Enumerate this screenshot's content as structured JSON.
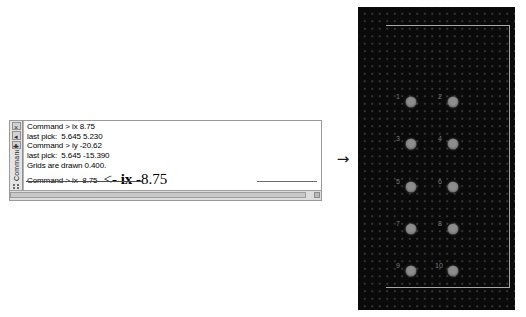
{
  "command_window": {
    "dock": {
      "title": "Command",
      "close_icon_label": "×",
      "collapse_icon_label": "◂",
      "pin_icon_label": "✚",
      "grip_name": "dock-grip"
    },
    "lines": [
      "Command > ix 8.75",
      "last pick:  5.645 5.230",
      "Command > iy -20.62",
      "last pick:  5.645 -15.390",
      "Grids are drawn 0.400.",
      "Command > ix -8.75"
    ],
    "annotation": {
      "arrow": "<- ",
      "command": "ix",
      "value": " -8.75"
    },
    "scrollbar": {
      "orientation": "horizontal",
      "thumb_name": "hscroll-thumb",
      "right_button_name": "hscroll-right-button"
    }
  },
  "flow": {
    "arrow": "→"
  },
  "pcb_panel": {
    "background_color": "#0a0a0a",
    "grid_dot_color": "#3b3b3b",
    "outline_color": "#a8a8a8",
    "pad_color": "#8d8d8d",
    "label_color": "#7c7c7c",
    "pads": [
      {
        "label": "1",
        "cx": 53,
        "cy": 95,
        "label_x": 40,
        "label_y": 89
      },
      {
        "label": "2",
        "cx": 95,
        "cy": 95,
        "label_x": 82,
        "label_y": 89
      },
      {
        "label": "3",
        "cx": 53,
        "cy": 137,
        "label_x": 40,
        "label_y": 131
      },
      {
        "label": "4",
        "cx": 95,
        "cy": 137,
        "label_x": 82,
        "label_y": 131
      },
      {
        "label": "5",
        "cx": 53,
        "cy": 180,
        "label_x": 40,
        "label_y": 174
      },
      {
        "label": "6",
        "cx": 95,
        "cy": 180,
        "label_x": 82,
        "label_y": 174
      },
      {
        "label": "7",
        "cx": 53,
        "cy": 222,
        "label_x": 40,
        "label_y": 216
      },
      {
        "label": "8",
        "cx": 95,
        "cy": 222,
        "label_x": 82,
        "label_y": 216
      },
      {
        "label": "9",
        "cx": 53,
        "cy": 264,
        "label_x": 40,
        "label_y": 258
      },
      {
        "label": "10",
        "cx": 95,
        "cy": 264,
        "label_x": 81,
        "label_y": 258
      }
    ]
  }
}
